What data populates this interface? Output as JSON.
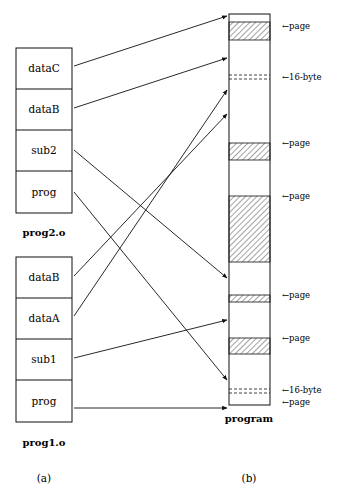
{
  "diagram": {
    "panel_a": {
      "label": "(a)",
      "modules": [
        {
          "name": "prog2.o",
          "sections": [
            "dataC",
            "dataB",
            "sub2",
            "prog"
          ]
        },
        {
          "name": "prog1.o",
          "sections": [
            "dataB",
            "dataA",
            "sub1",
            "prog"
          ]
        }
      ]
    },
    "panel_b": {
      "label": "(b)",
      "name": "program",
      "annotations": [
        {
          "text": "←page"
        },
        {
          "text": "←16-byte"
        },
        {
          "text": "←page"
        },
        {
          "text": "←page"
        },
        {
          "text": "←page"
        },
        {
          "text": "←page"
        },
        {
          "text": "←16-byte"
        },
        {
          "text": "←page"
        }
      ]
    }
  }
}
